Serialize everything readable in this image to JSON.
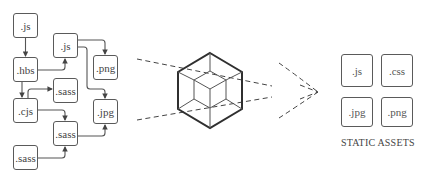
{
  "diagram": {
    "source_nodes": [
      {
        "id": "n1",
        "label": ".js",
        "x": 13,
        "y": 13,
        "w": 25,
        "h": 25
      },
      {
        "id": "n2",
        "label": ".hbs",
        "x": 13,
        "y": 57,
        "w": 25,
        "h": 25
      },
      {
        "id": "n3",
        "label": ".cjs",
        "x": 13,
        "y": 98,
        "w": 25,
        "h": 25
      },
      {
        "id": "n4",
        "label": ".sass",
        "x": 13,
        "y": 145,
        "w": 25,
        "h": 25
      },
      {
        "id": "n5",
        "label": ".js",
        "x": 53,
        "y": 33,
        "w": 25,
        "h": 25
      },
      {
        "id": "n6",
        "label": ".sass",
        "x": 53,
        "y": 78,
        "w": 25,
        "h": 25
      },
      {
        "id": "n7",
        "label": ".sass",
        "x": 53,
        "y": 121,
        "w": 25,
        "h": 25
      },
      {
        "id": "n8",
        "label": ".png",
        "x": 93,
        "y": 55,
        "w": 25,
        "h": 25
      },
      {
        "id": "n9",
        "label": ".jpg",
        "x": 93,
        "y": 99,
        "w": 25,
        "h": 25
      }
    ],
    "edges": [
      {
        "from": ".js (n1)",
        "to": ".hbs (n2)"
      },
      {
        "from": ".hbs (n2)",
        "to": ".js (n5)"
      },
      {
        "from": ".hbs (n2)",
        "to": ".cjs (n3)"
      },
      {
        "from": ".cjs (n3)",
        "to": ".sass (n6)"
      },
      {
        "from": ".cjs (n3)",
        "to": ".sass (n7)"
      },
      {
        "from": ".sass (n4)",
        "to": ".sass (n7)"
      },
      {
        "from": ".js (n5)",
        "to": ".png (n8)"
      },
      {
        "from": ".js (n5)",
        "to": ".jpg (n9)"
      },
      {
        "from": ".sass (n7)",
        "to": ".jpg (n9)"
      }
    ],
    "bundler_icon": "cube-icon",
    "output_assets": [
      {
        "label": ".js",
        "x": 341,
        "y": 54,
        "w": 32,
        "h": 33
      },
      {
        "label": ".css",
        "x": 381,
        "y": 54,
        "w": 32,
        "h": 33
      },
      {
        "label": ".jpg",
        "x": 341,
        "y": 97,
        "w": 32,
        "h": 30
      },
      {
        "label": ".png",
        "x": 381,
        "y": 97,
        "w": 32,
        "h": 30
      }
    ],
    "output_caption": "STATIC ASSETS",
    "colors": {
      "stroke": "#5a5a5a",
      "cube_stroke": "#333333",
      "dash": "#444444",
      "text": "#444444"
    }
  }
}
